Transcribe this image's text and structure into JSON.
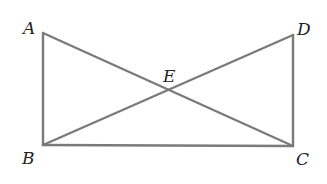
{
  "diagram": {
    "type": "geometry",
    "points": {
      "A": {
        "label": "A",
        "x": 43,
        "y": 33
      },
      "B": {
        "label": "B",
        "x": 43,
        "y": 145
      },
      "C": {
        "label": "C",
        "x": 293,
        "y": 146
      },
      "D": {
        "label": "D",
        "x": 293,
        "y": 35
      },
      "E": {
        "label": "E",
        "x": 167,
        "y": 90
      }
    },
    "segments": [
      "AB",
      "BC",
      "CD",
      "AC",
      "BD"
    ],
    "line_color": "#7a7a7a"
  }
}
